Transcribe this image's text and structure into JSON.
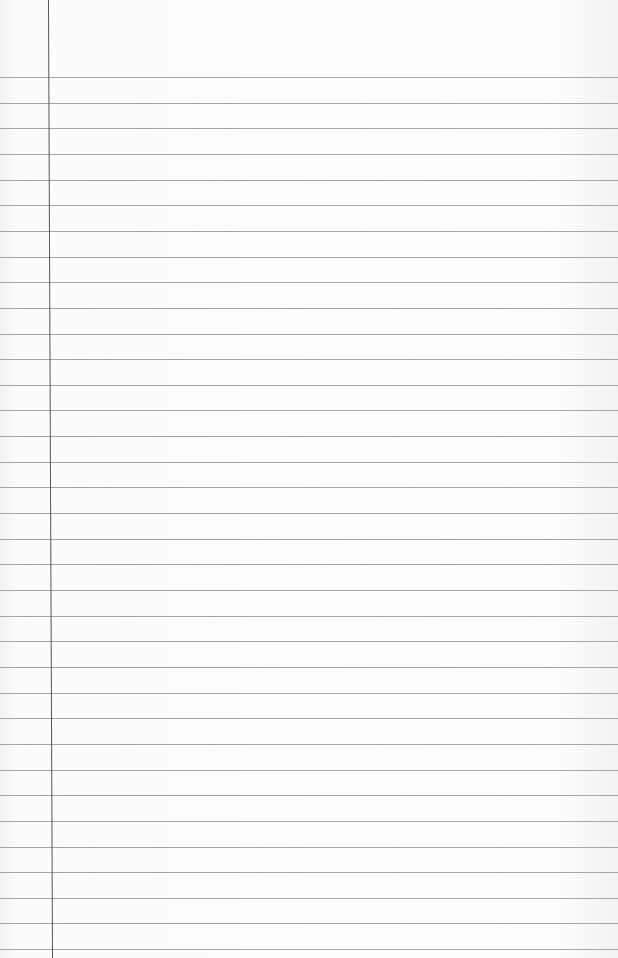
{
  "paper": {
    "type": "blank ruled notebook page",
    "line_count": 35,
    "first_line_y": 77,
    "line_spacing": 25.65,
    "margin_x_top": 48,
    "margin_x_bottom": 52,
    "colors": {
      "paper": "#fbfbfb",
      "rule": "#8a8a8a",
      "margin": "#555555"
    }
  }
}
